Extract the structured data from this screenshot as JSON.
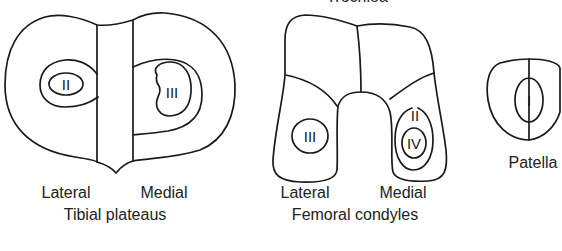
{
  "figure": {
    "top_cut_label": "Trochlea",
    "tibial_plateaus": {
      "title": "Tibial plateaus",
      "lateral_label": "Lateral",
      "medial_label": "Medial",
      "lateral_grade": "II",
      "medial_grade": "III"
    },
    "femoral_condyles": {
      "title": "Femoral condyles",
      "lateral_label": "Lateral",
      "medial_label": "Medial",
      "lateral_grade": "III",
      "medial_outer_grade": "II",
      "medial_inner_grade": "IV"
    },
    "patella": {
      "title": "Patella",
      "grade": "I"
    },
    "colors": {
      "line": "#1a1a1a",
      "text": "#222222",
      "background": "#ffffff"
    }
  }
}
